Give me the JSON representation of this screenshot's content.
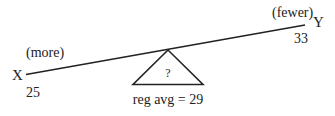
{
  "diagram": {
    "type": "seesaw-balance",
    "left_end": {
      "label": "X",
      "value": "25",
      "annotation": "(more)"
    },
    "right_end": {
      "label": "Y",
      "value": "33",
      "annotation": "(fewer)"
    },
    "fulcrum": {
      "symbol": "?",
      "caption": "reg avg = 29"
    },
    "colors": {
      "stroke": "#222222",
      "background": "#ffffff"
    }
  }
}
